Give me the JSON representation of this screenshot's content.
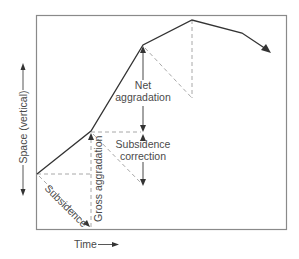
{
  "diagram": {
    "type": "accommodation-space-over-time",
    "colors": {
      "frame": "#8a8a8a",
      "main_line": "#333333",
      "dashed": "#a8a8a8",
      "arrow": "#333333",
      "text": "#4a4a4a"
    },
    "axes": {
      "x_label": "Time",
      "y_label": "Space (vertical)"
    },
    "labels": {
      "net_aggradation_line1": "Net",
      "net_aggradation_line2": "aggradation",
      "subsidence_correction_line1": "Subsidence",
      "subsidence_correction_line2": "correction",
      "gross_aggradation": "Gross aggradation",
      "subsidence": "Subsidence"
    },
    "main_path_points": [
      [
        37,
        174
      ],
      [
        91,
        131
      ],
      [
        143,
        45
      ],
      [
        192,
        20
      ],
      [
        242,
        33
      ],
      [
        270,
        52
      ]
    ]
  }
}
